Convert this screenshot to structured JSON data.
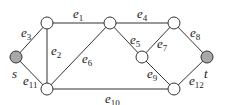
{
  "diagram": {
    "type": "graph",
    "colors": {
      "terminal_fill": "#a8a8a8",
      "node_fill": "#ffffff",
      "stroke": "#333333"
    },
    "nodes": [
      {
        "id": "s",
        "label": "s",
        "x": 16,
        "y": 57,
        "terminal": true
      },
      {
        "id": "a",
        "label": "",
        "x": 47,
        "y": 23
      },
      {
        "id": "b",
        "label": "",
        "x": 47,
        "y": 89
      },
      {
        "id": "c",
        "label": "",
        "x": 110,
        "y": 23
      },
      {
        "id": "d",
        "label": "",
        "x": 174,
        "y": 23
      },
      {
        "id": "e",
        "label": "",
        "x": 142,
        "y": 57
      },
      {
        "id": "f",
        "label": "",
        "x": 174,
        "y": 89
      },
      {
        "id": "t",
        "label": "t",
        "x": 207,
        "y": 57,
        "terminal": true
      }
    ],
    "edges": [
      {
        "name": "e",
        "sub": "1",
        "from": "a",
        "to": "c"
      },
      {
        "name": "e",
        "sub": "2",
        "from": "a",
        "to": "b"
      },
      {
        "name": "e",
        "sub": "3",
        "from": "s",
        "to": "a"
      },
      {
        "name": "e",
        "sub": "4",
        "from": "c",
        "to": "d"
      },
      {
        "name": "e",
        "sub": "5",
        "from": "c",
        "to": "e"
      },
      {
        "name": "e",
        "sub": "6",
        "from": "b",
        "to": "c"
      },
      {
        "name": "e",
        "sub": "7",
        "from": "e",
        "to": "d"
      },
      {
        "name": "e",
        "sub": "8",
        "from": "d",
        "to": "t"
      },
      {
        "name": "e",
        "sub": "9",
        "from": "e",
        "to": "f"
      },
      {
        "name": "e",
        "sub": "10",
        "from": "b",
        "to": "f"
      },
      {
        "name": "e",
        "sub": "11",
        "from": "s",
        "to": "b"
      },
      {
        "name": "e",
        "sub": "12",
        "from": "f",
        "to": "t"
      }
    ],
    "labels": {
      "s": "s",
      "t": "t",
      "e1": {
        "base": "e",
        "sub": "1"
      },
      "e2": {
        "base": "e",
        "sub": "2"
      },
      "e3": {
        "base": "e",
        "sub": "3"
      },
      "e4": {
        "base": "e",
        "sub": "4"
      },
      "e5": {
        "base": "e",
        "sub": "5"
      },
      "e6": {
        "base": "e",
        "sub": "6"
      },
      "e7": {
        "base": "e",
        "sub": "7"
      },
      "e8": {
        "base": "e",
        "sub": "8"
      },
      "e9": {
        "base": "e",
        "sub": "9"
      },
      "e10": {
        "base": "e",
        "sub": "10"
      },
      "e11": {
        "base": "e",
        "sub": "11"
      },
      "e12": {
        "base": "e",
        "sub": "12"
      }
    }
  }
}
